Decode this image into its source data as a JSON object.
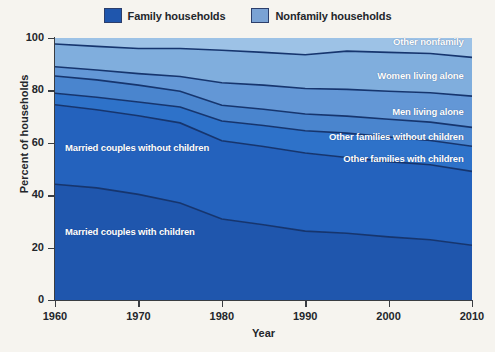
{
  "legend": {
    "items": [
      {
        "label": "Family households",
        "color": "#1f56ad"
      },
      {
        "label": "Nonfamily households",
        "color": "#7aa2d4"
      }
    ]
  },
  "axes": {
    "x": {
      "label": "Year",
      "ticks": [
        1960,
        1970,
        1980,
        1990,
        2000,
        2010
      ],
      "tick_labels": [
        "1960",
        "1970",
        "1980",
        "1990",
        "2000",
        "2010"
      ],
      "min": 1960,
      "max": 2010
    },
    "y": {
      "label": "Percent of households",
      "ticks": [
        0,
        20,
        40,
        60,
        80,
        100
      ],
      "tick_labels": [
        "0",
        "20",
        "40",
        "60",
        "80",
        "100"
      ],
      "min": 0,
      "max": 100
    }
  },
  "chart_data": {
    "type": "area",
    "title": "",
    "xlabel": "Year",
    "ylabel": "Percent of households",
    "xlim": [
      1960,
      2010
    ],
    "ylim": [
      0,
      100
    ],
    "grid": false,
    "legend_position": "top-center",
    "stacked": true,
    "stack_order": "bottom-to-top",
    "x": [
      1960,
      1965,
      1970,
      1975,
      1980,
      1985,
      1990,
      1995,
      2000,
      2005,
      2010
    ],
    "series": [
      {
        "name": "Married couples with children",
        "color": "#1f56ad",
        "label_position": "left",
        "values": [
          44.2,
          42.8,
          40.3,
          37.0,
          30.9,
          28.7,
          26.3,
          25.5,
          24.1,
          23.0,
          20.9
        ]
      },
      {
        "name": "Married couples without children",
        "color": "#2462bd",
        "label_position": "left",
        "values": [
          30.3,
          29.8,
          30.0,
          30.6,
          29.9,
          29.9,
          29.8,
          28.9,
          28.7,
          28.6,
          28.2
        ]
      },
      {
        "name": "Other families with children",
        "color": "#2e72c9",
        "label_position": "right",
        "values": [
          4.4,
          4.8,
          5.3,
          6.1,
          7.5,
          8.0,
          8.5,
          9.3,
          9.4,
          9.3,
          9.6
        ]
      },
      {
        "name": "Other families without children",
        "color": "#4a85ce",
        "label_position": "right",
        "values": [
          6.6,
          6.6,
          6.4,
          6.0,
          6.0,
          6.2,
          6.4,
          6.5,
          6.8,
          7.0,
          7.2
        ]
      },
      {
        "name": "Men living alone",
        "color": "#6397d6",
        "label_position": "right",
        "values": [
          3.5,
          3.8,
          4.4,
          5.6,
          8.6,
          9.2,
          9.7,
          10.2,
          10.7,
          11.2,
          11.9
        ]
      },
      {
        "name": "Women living alone",
        "color": "#80aedd",
        "label_position": "right",
        "values": [
          8.7,
          9.0,
          9.6,
          10.7,
          12.4,
          12.5,
          12.9,
          14.6,
          14.8,
          15.0,
          14.8
        ]
      },
      {
        "name": "Other nonfamily",
        "color": "#9dc2e6",
        "label_position": "right",
        "values": [
          2.3,
          3.2,
          4.0,
          4.0,
          4.7,
          5.5,
          6.4,
          5.0,
          5.5,
          5.9,
          7.4
        ]
      }
    ],
    "cumulative_top_boundaries_percent": {
      "note": "running totals, bottom series first",
      "1960": [
        44.2,
        74.5,
        78.9,
        85.5,
        89.0,
        97.7,
        100.0
      ],
      "2010": [
        20.9,
        49.1,
        58.7,
        65.9,
        77.8,
        92.6,
        100.0
      ]
    }
  },
  "plot_style": {
    "boundary_line_color": "#16356e",
    "background": "#f6f4ef",
    "axis_color": "#3a3d42",
    "label_text_color": "#ffffff"
  }
}
